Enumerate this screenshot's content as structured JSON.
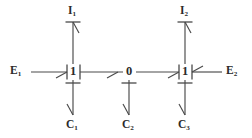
{
  "diagram": {
    "type": "bond-graph",
    "title": "",
    "width": 252,
    "height": 138,
    "colors": {
      "background": "#ffffff",
      "stroke": "#4a4a4a",
      "text": "#2b2b2b"
    },
    "junctions": [
      {
        "id": "j1",
        "label": "1",
        "sub": "",
        "x": 73,
        "y": 72
      },
      {
        "id": "j0",
        "label": "0",
        "sub": "",
        "x": 129,
        "y": 72
      },
      {
        "id": "j2",
        "label": "1",
        "sub": "",
        "x": 185,
        "y": 72
      }
    ],
    "elements": [
      {
        "id": "e1",
        "label": "E",
        "sub": "1",
        "x": 20,
        "y": 72,
        "kind": "effort-source"
      },
      {
        "id": "e2",
        "label": "E",
        "sub": "2",
        "x": 233,
        "y": 72,
        "kind": "effort-source"
      },
      {
        "id": "i1",
        "label": "I",
        "sub": "1",
        "x": 73,
        "y": 12,
        "kind": "inertia"
      },
      {
        "id": "i2",
        "label": "I",
        "sub": "2",
        "x": 185,
        "y": 12,
        "kind": "inertia"
      },
      {
        "id": "c1",
        "label": "C",
        "sub": "1",
        "x": 73,
        "y": 127,
        "kind": "capacitor"
      },
      {
        "id": "c2",
        "label": "C",
        "sub": "2",
        "x": 129,
        "y": 127,
        "kind": "capacitor"
      },
      {
        "id": "c3",
        "label": "C",
        "sub": "3",
        "x": 185,
        "y": 127,
        "kind": "capacitor"
      }
    ],
    "bonds": [
      {
        "id": "b1",
        "from": "e1",
        "to": "j1",
        "direction": "right",
        "causality": "at-junction-left"
      },
      {
        "id": "b2",
        "from": "j1",
        "to": "j0",
        "direction": "right",
        "causality": "at-junction-right"
      },
      {
        "id": "b3",
        "from": "j0",
        "to": "j2",
        "direction": "right",
        "causality": "at-junction-left"
      },
      {
        "id": "b4",
        "from": "e2",
        "to": "j2",
        "direction": "left",
        "causality": "at-junction-right"
      },
      {
        "id": "b5",
        "from": "j1",
        "to": "i1",
        "direction": "up",
        "causality": "at-element"
      },
      {
        "id": "b6",
        "from": "j2",
        "to": "i2",
        "direction": "up",
        "causality": "at-element"
      },
      {
        "id": "b7",
        "from": "j1",
        "to": "c1",
        "direction": "down",
        "causality": "at-junction"
      },
      {
        "id": "b8",
        "from": "j0",
        "to": "c2",
        "direction": "down",
        "causality": "at-junction"
      },
      {
        "id": "b9",
        "from": "j2",
        "to": "c3",
        "direction": "down",
        "causality": "at-junction"
      }
    ]
  }
}
